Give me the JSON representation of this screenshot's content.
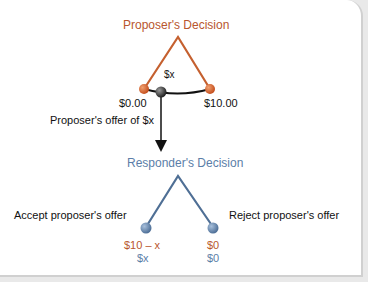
{
  "proposer": {
    "title": "Proposer's Decision",
    "left_value": "$0.00",
    "right_value": "$10.00",
    "offer_marker": "$x",
    "color": "#b8562e"
  },
  "offer_label": "Proposer's offer of $x",
  "responder": {
    "title": "Responder's Decision",
    "accept_label": "Accept proposer's offer",
    "reject_label": "Reject proposer's offer",
    "color": "#5b7ea8",
    "accept_payoffs": {
      "proposer": "$10 – x",
      "responder": "$x"
    },
    "reject_payoffs": {
      "proposer": "$0",
      "responder": "$0"
    }
  }
}
